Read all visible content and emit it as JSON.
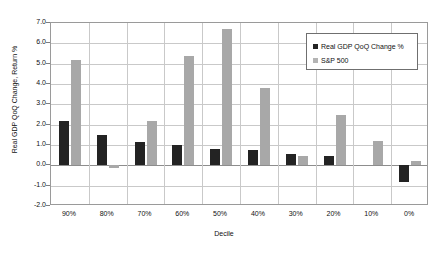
{
  "chart_data": {
    "type": "bar",
    "title": "",
    "xlabel": "Decile",
    "ylabel": "Real GDP QoQ Change, Return %",
    "ylim": [
      -2.0,
      7.0
    ],
    "ytick_step": 1.0,
    "yticks": [
      "7.0",
      "6.0",
      "5.0",
      "4.0",
      "3.0",
      "2.0",
      "1.0",
      "0.0",
      "-1.0",
      "-2.0"
    ],
    "ytick_values": [
      7.0,
      6.0,
      5.0,
      4.0,
      3.0,
      2.0,
      1.0,
      0.0,
      -1.0,
      -2.0
    ],
    "grid": true,
    "legend_position": "top-right",
    "categories": [
      "90%",
      "80%",
      "70%",
      "60%",
      "50%",
      "40%",
      "30%",
      "20%",
      "10%",
      "0%"
    ],
    "series": [
      {
        "name": "Real GDP QoQ Change %",
        "color": "#232323",
        "values": [
          2.2,
          1.5,
          1.15,
          1.0,
          0.8,
          0.75,
          0.55,
          0.45,
          0.0,
          -0.8
        ]
      },
      {
        "name": "S&P 500",
        "color": "#a8a8a8",
        "values": [
          5.2,
          -0.15,
          2.2,
          5.4,
          6.7,
          3.8,
          0.45,
          2.5,
          1.2,
          0.2
        ]
      }
    ]
  },
  "legend": {
    "items": [
      {
        "label": "Real GDP QoQ Change %",
        "marker": "square-dark"
      },
      {
        "label": "S&P 500",
        "marker": "square-light"
      }
    ]
  },
  "axes": {
    "x_title": "Decile",
    "y_title": "Real GDP QoQ Change, Return %"
  }
}
